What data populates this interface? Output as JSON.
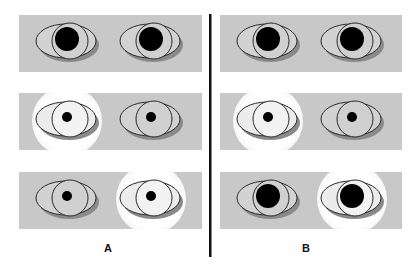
{
  "figure": {
    "panels": [
      {
        "label": "A",
        "label_x": 108,
        "rows": [
          {
            "row": 1,
            "left_eye": {
              "glow": false,
              "iris": "gray",
              "pupil": "large"
            },
            "right_eye": {
              "glow": false,
              "iris": "gray",
              "pupil": "large"
            }
          },
          {
            "row": 2,
            "left_eye": {
              "glow": true,
              "iris": "light",
              "pupil": "small"
            },
            "right_eye": {
              "glow": false,
              "iris": "gray",
              "pupil": "small"
            }
          },
          {
            "row": 3,
            "left_eye": {
              "glow": false,
              "iris": "gray",
              "pupil": "small"
            },
            "right_eye": {
              "glow": true,
              "iris": "light",
              "pupil": "small"
            }
          }
        ]
      },
      {
        "label": "B",
        "label_x": 306,
        "rows": [
          {
            "row": 1,
            "left_eye": {
              "glow": false,
              "iris": "gray",
              "pupil": "large"
            },
            "right_eye": {
              "glow": false,
              "iris": "gray",
              "pupil": "large"
            }
          },
          {
            "row": 2,
            "left_eye": {
              "glow": true,
              "iris": "light",
              "pupil": "small"
            },
            "right_eye": {
              "glow": false,
              "iris": "gray",
              "pupil": "small"
            }
          },
          {
            "row": 3,
            "left_eye": {
              "glow": false,
              "iris": "gray",
              "pupil": "large"
            },
            "right_eye": {
              "glow": true,
              "iris": "light",
              "pupil": "large"
            }
          }
        ]
      }
    ],
    "colors": {
      "panel_bg": "#c8c8c8",
      "sclera": "#d2d2d2",
      "sclera_lit": "#ececec",
      "iris_gray": "#d0d0d0",
      "iris_lit": "#f2f2f2",
      "outline": "#2a2a2a",
      "pupil": "#000000",
      "shadow": "#8a8a8a",
      "glow": "#ffffff",
      "divider": "#111111"
    }
  }
}
